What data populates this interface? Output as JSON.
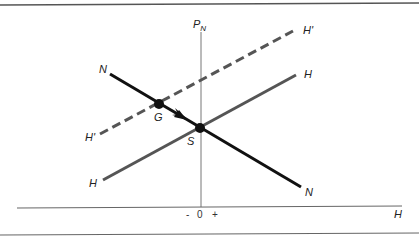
{
  "diagram": {
    "axes": {
      "y_label": "P",
      "y_label_sub": "N",
      "x_label": "H",
      "origin_label": "0",
      "minus_label": "-",
      "plus_label": "+"
    },
    "curves": {
      "N": {
        "label_start": "N",
        "label_end": "N",
        "color": "#111111",
        "style": "solid"
      },
      "H": {
        "label_start": "H",
        "label_end": "H",
        "color": "#555555",
        "style": "solid"
      },
      "H_prime": {
        "label_start": "H'",
        "label_end": "H'",
        "color": "#555555",
        "style": "dashed"
      }
    },
    "points": {
      "G": {
        "label": "G"
      },
      "S": {
        "label": "S"
      }
    },
    "colors": {
      "border": "#555555",
      "axis": "#666666"
    }
  }
}
